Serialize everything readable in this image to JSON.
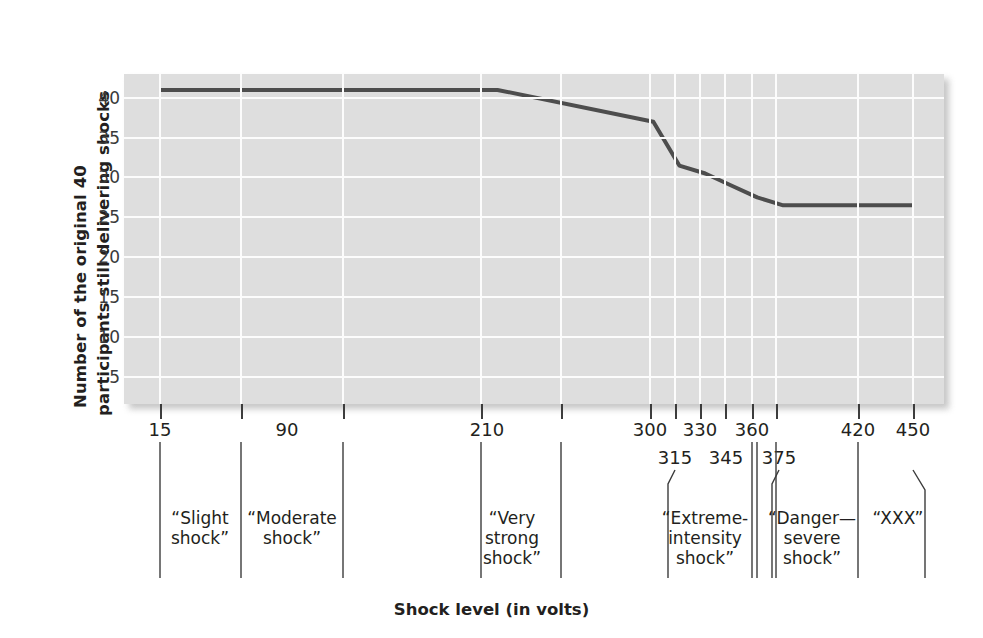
{
  "chart_data": {
    "type": "line",
    "title": "",
    "xlabel": "Shock level (in volts)",
    "ylabel_line1": "Number of the original 40",
    "ylabel_line2": "participants still delivering shocks",
    "ylim": [
      0,
      43
    ],
    "yticks": [
      5,
      10,
      15,
      20,
      25,
      30,
      35,
      40
    ],
    "xlim": [
      15,
      450
    ],
    "grid": true,
    "legend": "none",
    "x": [
      15,
      90,
      210,
      300,
      315,
      330,
      345,
      360,
      375,
      420,
      450
    ],
    "values": [
      41,
      41,
      41,
      37,
      31.5,
      30.5,
      29,
      27.5,
      26.5,
      26.5,
      26.5
    ],
    "series": [
      {
        "name": "Participants still delivering shocks",
        "color": "#4d4d4d",
        "values": [
          41,
          41,
          41,
          37,
          31.5,
          30.5,
          29,
          27.5,
          26.5,
          26.5,
          26.5
        ]
      }
    ],
    "xtick_labels_row1": [
      "15",
      "90",
      "210",
      "300",
      "330",
      "360",
      "420",
      "450"
    ],
    "xtick_labels_row2": [
      "315",
      "345",
      "375"
    ],
    "category_bands": [
      {
        "label": "“Slight\nshock”",
        "from": 15,
        "to": 90
      },
      {
        "label": "“Moderate\nshock”",
        "from": 90,
        "to": 180
      },
      {
        "label": "“Very\nstrong\nshock”",
        "from": 210,
        "to": 255
      },
      {
        "label": "“Extreme-\nintensity\nshock”",
        "from": 315,
        "to": 360
      },
      {
        "label": "“Danger—\nsevere\nshock”",
        "from": 375,
        "to": 420
      },
      {
        "label": "“XXX”",
        "from": 420,
        "to": 450
      }
    ]
  },
  "axes": {
    "y_title_line1": "Number of the original 40",
    "y_title_line2": "participants still delivering shocks",
    "x_title": "Shock level (in volts)",
    "y_tick_labels": [
      "40",
      "35",
      "30",
      "25",
      "20",
      "15",
      "10",
      "5"
    ],
    "plot_background": "#dedede",
    "gridline_color": "#fcfcfc",
    "line_color": "#4d4d4d",
    "text_color": "#231f20"
  },
  "x_numbers_row1": [
    {
      "text": "15",
      "px": 160
    },
    {
      "text": "90",
      "px": 287
    },
    {
      "text": "210",
      "px": 487
    },
    {
      "text": "300",
      "px": 650
    },
    {
      "text": "330",
      "px": 700
    },
    {
      "text": "360",
      "px": 752
    },
    {
      "text": "420",
      "px": 858
    },
    {
      "text": "450",
      "px": 913
    }
  ],
  "x_numbers_row2": [
    {
      "text": "315",
      "px": 675
    },
    {
      "text": "345",
      "px": 726
    },
    {
      "text": "375",
      "px": 779
    }
  ],
  "tick_positions_px": [
    160,
    241,
    343,
    481,
    561,
    650,
    675,
    700,
    725,
    752,
    776,
    858,
    913
  ],
  "categories": [
    {
      "name": "slight-shock",
      "text": "“Slight\nshock”",
      "cx": 200,
      "top": 508
    },
    {
      "name": "moderate-shock",
      "text": "“Moderate\nshock”",
      "cx": 292,
      "top": 508
    },
    {
      "name": "very-strong-shock",
      "text": "“Very\nstrong\nshock”",
      "cx": 512,
      "top": 508
    },
    {
      "name": "extreme-intensity-shock",
      "text": "“Extreme-\nintensity\nshock”",
      "cx": 705,
      "top": 508
    },
    {
      "name": "danger-severe-shock",
      "text": "“Danger—\nsevere\nshock”",
      "cx": 812,
      "top": 508
    },
    {
      "name": "xxx",
      "text": "“XXX”",
      "cx": 898,
      "top": 508
    }
  ]
}
